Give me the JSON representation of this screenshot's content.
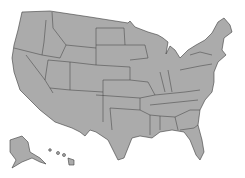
{
  "map": {
    "title": "United States map",
    "fill_color": "#ababab",
    "border_color": "#3c3c3c",
    "background": "#ffffff",
    "regions": [
      "Contiguous United States",
      "Alaska",
      "Hawaii"
    ]
  }
}
